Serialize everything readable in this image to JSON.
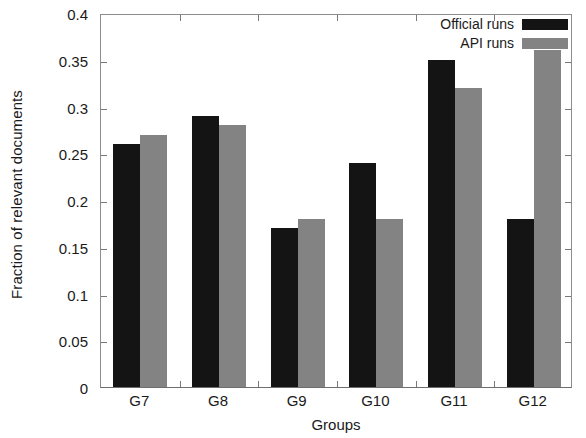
{
  "chart_data": {
    "type": "bar",
    "title": "",
    "xlabel": "Groups",
    "ylabel": "Fraction of relevant documents",
    "categories": [
      "G7",
      "G8",
      "G9",
      "G10",
      "G11",
      "G12"
    ],
    "series": [
      {
        "name": "Official runs",
        "color": "#141414",
        "values": [
          0.26,
          0.29,
          0.17,
          0.24,
          0.35,
          0.18
        ]
      },
      {
        "name": "API runs",
        "color": "#838383",
        "values": [
          0.27,
          0.28,
          0.18,
          0.18,
          0.32,
          0.36
        ]
      }
    ],
    "ylim": [
      0,
      0.4
    ],
    "yticks": [
      0,
      0.05,
      0.1,
      0.15,
      0.2,
      0.25,
      0.3,
      0.35,
      0.4
    ],
    "ytick_labels": [
      "0",
      "0.05",
      "0.1",
      "0.15",
      "0.2",
      "0.25",
      "0.3",
      "0.35",
      "0.4"
    ],
    "grid": false,
    "legend_position": "top-right",
    "legend_entries": [
      "Official runs",
      "API runs"
    ]
  }
}
